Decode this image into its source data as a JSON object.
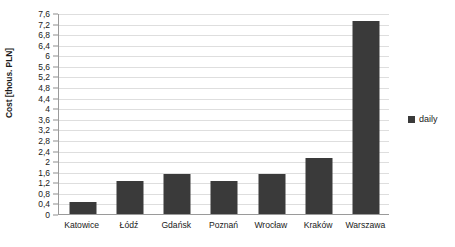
{
  "chart_data": {
    "type": "bar",
    "title": "",
    "xlabel": "",
    "ylabel": "Cost [thous. PLN]",
    "categories": [
      "Katowice",
      "Łódź",
      "Gdańsk",
      "Poznań",
      "Wrocław",
      "Kraków",
      "Warszawa"
    ],
    "series": [
      {
        "name": "daily",
        "values": [
          0.45,
          1.25,
          1.5,
          1.25,
          1.5,
          2.1,
          7.3
        ]
      }
    ],
    "ylim": [
      0,
      7.6
    ],
    "ytick_step": 0.4,
    "ytick_labels": [
      "7,6",
      "7,2",
      "6,8",
      "6,4",
      "6",
      "5,6",
      "5,2",
      "4,8",
      "4,4",
      "4",
      "3,6",
      "3,2",
      "2,8",
      "2,4",
      "2",
      "1,6",
      "1,2",
      "0,8",
      "0,4",
      "0"
    ],
    "ytick_values": [
      7.6,
      7.2,
      6.8,
      6.4,
      6.0,
      5.6,
      5.2,
      4.8,
      4.4,
      4.0,
      3.6,
      3.2,
      2.8,
      2.4,
      2.0,
      1.6,
      1.2,
      0.8,
      0.4,
      0
    ],
    "grid": true,
    "legend_position": "right",
    "bar_color": "#3a3a3a",
    "grid_color": "#dedede",
    "axis_color": "#9a9a9a"
  },
  "legend": {
    "entries": [
      {
        "label": "daily",
        "color": "#3a3a3a"
      }
    ]
  }
}
